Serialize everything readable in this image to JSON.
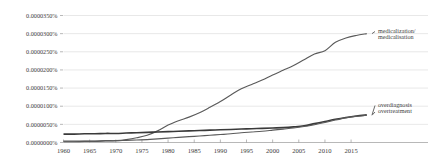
{
  "chart_data": {
    "type": "line",
    "title": "",
    "subtitle": "",
    "xlabel": "",
    "ylabel": "",
    "grid": true,
    "legend_position": "right-inline",
    "xlim": [
      1960,
      2019
    ],
    "ylim": [
      0.0,
      3.5e-05
    ],
    "xticks": [
      1960,
      1965,
      1970,
      1975,
      1980,
      1985,
      1990,
      1995,
      2000,
      2005,
      2010,
      2015
    ],
    "xtick_labels": [
      "1960",
      "1965",
      "1970",
      "1975",
      "1980",
      "1985",
      "1990",
      "1995",
      "2000",
      "2005",
      "2010",
      "2015"
    ],
    "yticks": [
      0.0,
      5e-06,
      1e-05,
      1.5e-05,
      2e-05,
      2.5e-05,
      3e-05,
      3.5e-05
    ],
    "ytick_labels": [
      "0.0000000%",
      "0.0000050%",
      "0.0000100%",
      "0.0000150%",
      "0.0000200%",
      "0.0000250%",
      "0.0000300%",
      "0.0000350%"
    ],
    "x": [
      1960,
      1962,
      1964,
      1966,
      1968,
      1970,
      1972,
      1974,
      1976,
      1978,
      1980,
      1982,
      1984,
      1986,
      1988,
      1990,
      1992,
      1994,
      1996,
      1998,
      2000,
      2002,
      2004,
      2006,
      2008,
      2010,
      2012,
      2014,
      2016,
      2018
    ],
    "series": [
      {
        "name": "medicalization/medicalisation",
        "color": "#5a5a5a",
        "label_lines": [
          "medicalization/",
          "medicalisation"
        ],
        "values": [
          2e-07,
          2e-07,
          3e-07,
          3e-07,
          4e-07,
          5e-07,
          8e-07,
          1.3e-06,
          2e-06,
          3.2e-06,
          4.8e-06,
          6e-06,
          7e-06,
          8.2e-06,
          9.7e-06,
          1.13e-05,
          1.31e-05,
          1.48e-05,
          1.6e-05,
          1.72e-05,
          1.86e-05,
          1.99e-05,
          2.12e-05,
          2.28e-05,
          2.44e-05,
          2.53e-05,
          2.76e-05,
          2.88e-05,
          2.95e-05,
          3e-05
        ]
      },
      {
        "name": "overdiagnosis",
        "color": "#3a3a3a",
        "label_lines": [
          "overdiagnosis"
        ],
        "values": [
          2.3e-06,
          2.3e-06,
          2.4e-06,
          2.4e-06,
          2.5e-06,
          2.5e-06,
          2.6e-06,
          2.7e-06,
          2.8e-06,
          2.9e-06,
          3e-06,
          3.1e-06,
          3.2e-06,
          3.3e-06,
          3.4e-06,
          3.5e-06,
          3.6e-06,
          3.7e-06,
          3.8e-06,
          3.9e-06,
          4e-06,
          4.1e-06,
          4.3e-06,
          4.6e-06,
          5.2e-06,
          5.8e-06,
          6.4e-06,
          6.9e-06,
          7.3e-06,
          7.6e-06
        ]
      },
      {
        "name": "overtreatment",
        "color": "#4a4a4a",
        "label_lines": [
          "overtreatment"
        ],
        "values": [
          4e-07,
          4e-07,
          4e-07,
          4e-07,
          5e-07,
          5e-07,
          6e-07,
          7e-07,
          8e-07,
          1e-06,
          1.2e-06,
          1.4e-06,
          1.6e-06,
          1.8e-06,
          2e-06,
          2.2e-06,
          2.4e-06,
          2.7e-06,
          2.9e-06,
          3.1e-06,
          3.4e-06,
          3.7e-06,
          4e-06,
          4.4e-06,
          4.9e-06,
          5.5e-06,
          6.2e-06,
          6.8e-06,
          7.2e-06,
          7.5e-06
        ]
      }
    ],
    "annotations": [
      {
        "text": "medicalization/ medicalisation",
        "target_series": "medicalization/medicalisation"
      },
      {
        "text": "overdiagnosis",
        "target_series": "overdiagnosis"
      },
      {
        "text": "overtreatment",
        "target_series": "overtreatment"
      }
    ]
  }
}
